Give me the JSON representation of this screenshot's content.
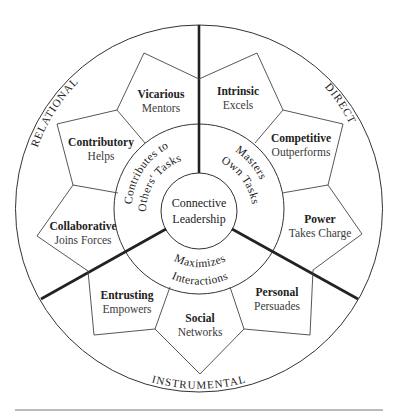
{
  "diagram": {
    "center": {
      "line1": "Connective",
      "line2": "Leadership"
    },
    "middle_ring": [
      {
        "id": "relational",
        "line1": "Contributes to",
        "line2": "Others' Tasks"
      },
      {
        "id": "direct",
        "line1": "Masters",
        "line2": "Own Tasks"
      },
      {
        "id": "instrumental",
        "line1": "Maximizes",
        "line2": "Interactions"
      }
    ],
    "outer_labels": {
      "relational": "RELATIONAL",
      "direct": "DIRECT",
      "instrumental": "INSTRUMENTAL"
    },
    "styles": [
      {
        "name": "Vicarious",
        "desc": "Mentors",
        "group": "relational"
      },
      {
        "name": "Contributory",
        "desc": "Helps",
        "group": "relational"
      },
      {
        "name": "Collaborative",
        "desc": "Joins Forces",
        "group": "relational"
      },
      {
        "name": "Intrinsic",
        "desc": "Excels",
        "group": "direct"
      },
      {
        "name": "Competitive",
        "desc": "Outperforms",
        "group": "direct"
      },
      {
        "name": "Power",
        "desc": "Takes Charge",
        "group": "direct"
      },
      {
        "name": "Entrusting",
        "desc": "Empowers",
        "group": "instrumental"
      },
      {
        "name": "Social",
        "desc": "Networks",
        "group": "instrumental"
      },
      {
        "name": "Personal",
        "desc": "Persuades",
        "group": "instrumental"
      }
    ],
    "colors": {
      "line": "#222222",
      "background": "#ffffff",
      "text": "#222222"
    }
  }
}
